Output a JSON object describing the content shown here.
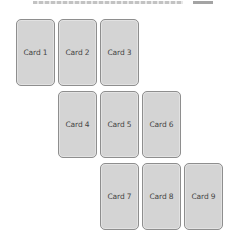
{
  "heading": {
    "text": "",
    "clipped": true
  },
  "colors": {
    "card_fill": "#d4d4d4",
    "card_border": "#8e8e8e",
    "card_text": "#444444",
    "background": "#ffffff"
  },
  "cards": [
    {
      "label": "Card 1",
      "row": 0,
      "col": 0
    },
    {
      "label": "Card 2",
      "row": 0,
      "col": 1
    },
    {
      "label": "Card 3",
      "row": 0,
      "col": 2
    },
    {
      "label": "Card 4",
      "row": 1,
      "col": 1
    },
    {
      "label": "Card 5",
      "row": 1,
      "col": 2
    },
    {
      "label": "Card 6",
      "row": 1,
      "col": 3
    },
    {
      "label": "Card 7",
      "row": 2,
      "col": 2
    },
    {
      "label": "Card 8",
      "row": 2,
      "col": 3
    },
    {
      "label": "Card 9",
      "row": 2,
      "col": 4
    }
  ]
}
